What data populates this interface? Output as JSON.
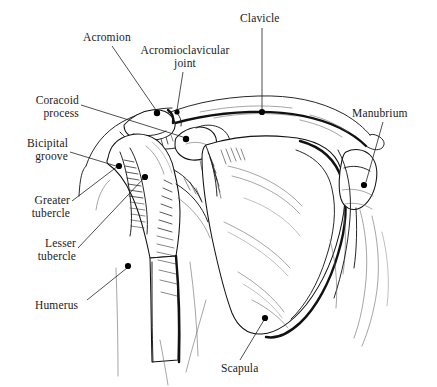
{
  "figure": {
    "background_color": "#ffffff",
    "ink_color": "#111111",
    "width": 437,
    "height": 387
  },
  "labels": [
    {
      "id": "acromion",
      "name": "Acromion",
      "line1": "Acromion",
      "line2": "",
      "x": 83,
      "y": 31,
      "align": "left",
      "marker_x": 157,
      "marker_y": 113
    },
    {
      "id": "acromioclavicular-joint",
      "name": "Acromioclavicular joint",
      "line1": "Acromioclavicular",
      "line2": "joint",
      "x": 139,
      "y": 44,
      "align": "center",
      "marker_x": 179,
      "marker_y": 112
    },
    {
      "id": "clavicle",
      "name": "Clavicle",
      "line1": "Clavicle",
      "line2": "",
      "x": 240,
      "y": 12,
      "align": "left",
      "marker_x": 262,
      "marker_y": 112
    },
    {
      "id": "coracoid-process",
      "name": "Coracoid process",
      "line1": "Coracoid",
      "line2": "process",
      "x": 20,
      "y": 94,
      "align": "right",
      "marker_x": 186,
      "marker_y": 138
    },
    {
      "id": "manubrium",
      "name": "Manubrium",
      "line1": "Manubrium",
      "line2": "",
      "x": 352,
      "y": 107,
      "align": "left",
      "marker_x": 364,
      "marker_y": 185
    },
    {
      "id": "bicipital-groove",
      "name": "Bicipital groove",
      "line1": "Bicipital",
      "line2": "groove",
      "x": 18,
      "y": 137,
      "align": "right",
      "marker_x": 119,
      "marker_y": 166
    },
    {
      "id": "greater-tubercle",
      "name": "Greater tubercle",
      "line1": "Greater",
      "line2": "tubercle",
      "x": 24,
      "y": 194,
      "align": "right",
      "marker_x": 145,
      "marker_y": 177
    },
    {
      "id": "lesser-tubercle",
      "name": "Lesser tubercle",
      "line1": "Lesser",
      "line2": "tubercle",
      "x": 33,
      "y": 237,
      "align": "right",
      "marker_x": 119,
      "marker_y": 166
    },
    {
      "id": "humerus",
      "name": "Humerus",
      "line1": "Humerus",
      "line2": "",
      "x": 35,
      "y": 299,
      "align": "left",
      "marker_x": 128,
      "marker_y": 266
    },
    {
      "id": "scapula",
      "name": "Scapula",
      "line1": "Scapula",
      "line2": "",
      "x": 221,
      "y": 362,
      "align": "left",
      "marker_x": 265,
      "marker_y": 318
    }
  ],
  "structures": [
    {
      "id": "clavicle-bone",
      "name": "Clavicle"
    },
    {
      "id": "scapula-bone",
      "name": "Scapula"
    },
    {
      "id": "humerus-bone",
      "name": "Humerus"
    },
    {
      "id": "acromion-process",
      "name": "Acromion"
    },
    {
      "id": "coracoid-process-bone",
      "name": "Coracoid process"
    },
    {
      "id": "manubrium-bone",
      "name": "Manubrium"
    },
    {
      "id": "ribcage-contour",
      "name": "Rib contour"
    }
  ]
}
